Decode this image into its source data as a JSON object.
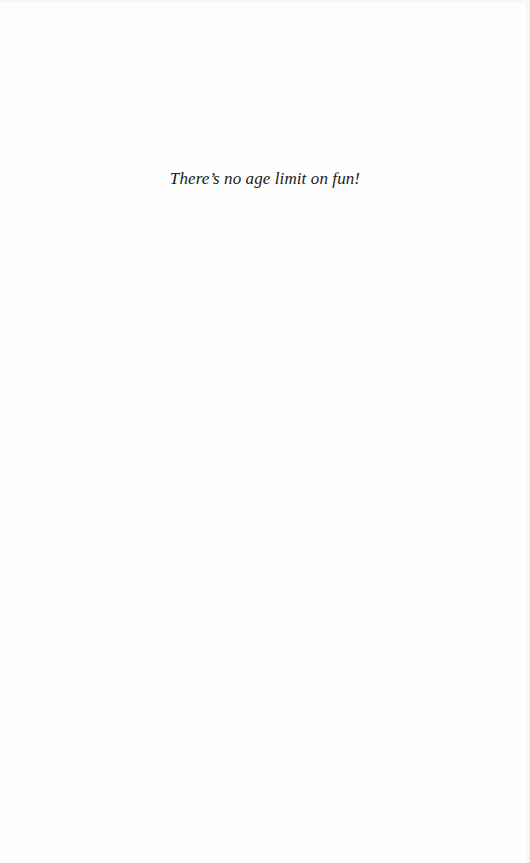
{
  "page": {
    "epigraph": "There’s no age limit on fun!"
  }
}
